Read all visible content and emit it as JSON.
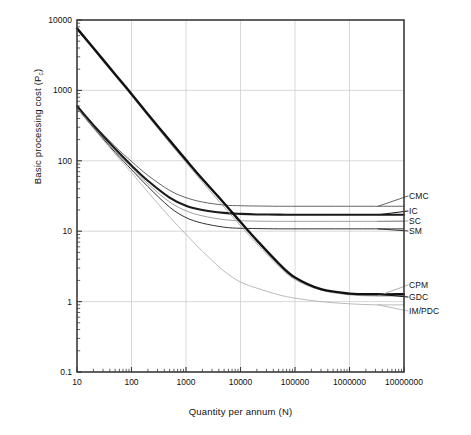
{
  "chart_data": {
    "type": "line",
    "title": "",
    "xlabel": "Quantity per annum (N)",
    "ylabel_prefix": "Basic processing cost (P",
    "ylabel_sub": "c",
    "ylabel_suffix": ")",
    "xscale": "log",
    "yscale": "log",
    "xlim": [
      10,
      10000000
    ],
    "ylim": [
      0.1,
      10000
    ],
    "grid": true,
    "legend_position": "right-inline",
    "xticks": [
      10,
      100,
      1000,
      10000,
      100000,
      1000000,
      10000000
    ],
    "xtick_labels": [
      "10",
      "100",
      "1000",
      "10000",
      "100000",
      "1000000",
      "10000000"
    ],
    "yticks": [
      0.1,
      1,
      10,
      100,
      1000,
      10000
    ],
    "ytick_labels": [
      "0.1",
      "1",
      "10",
      "100",
      "1000",
      "10000"
    ],
    "series": [
      {
        "name": "CMC",
        "label": "CMC",
        "color": "#555555",
        "width": 0.9,
        "label_y": 196,
        "x": [
          10,
          20,
          50,
          100,
          200,
          500,
          1000,
          2000,
          5000,
          10000,
          20000,
          50000,
          100000,
          300000,
          1000000,
          3000000,
          10000000
        ],
        "y": [
          600,
          330,
          160,
          98,
          62,
          38,
          30,
          26,
          23.5,
          23.0,
          22.8,
          22.6,
          22.6,
          22.6,
          22.6,
          22.6,
          22.6
        ]
      },
      {
        "name": "IC",
        "label": "IC",
        "color": "#1a1a1a",
        "width": 2.1,
        "label_y": 211,
        "x": [
          10,
          20,
          50,
          100,
          200,
          500,
          1000,
          2000,
          5000,
          10000,
          20000,
          50000,
          100000,
          300000,
          1000000,
          3000000,
          10000000
        ],
        "y": [
          600,
          320,
          148,
          86,
          52,
          30,
          23,
          20,
          18.2,
          17.6,
          17.3,
          17.2,
          17.1,
          17.1,
          17.1,
          17.1,
          17.1
        ]
      },
      {
        "name": "SC",
        "label": "SC",
        "color": "#888888",
        "width": 0.8,
        "label_y": 221,
        "x": [
          10,
          20,
          50,
          100,
          200,
          500,
          1000,
          2000,
          5000,
          10000,
          20000,
          50000,
          100000,
          300000,
          1000000,
          3000000,
          10000000
        ],
        "y": [
          560,
          300,
          138,
          80,
          47,
          26,
          19.5,
          16.5,
          14.6,
          14.1,
          13.9,
          13.8,
          13.8,
          13.8,
          13.8,
          13.8,
          13.8
        ]
      },
      {
        "name": "SM",
        "label": "SM",
        "color": "#333333",
        "width": 1.0,
        "label_y": 231,
        "x": [
          10,
          20,
          50,
          100,
          200,
          500,
          1000,
          2000,
          5000,
          10000,
          20000,
          50000,
          100000,
          300000,
          1000000,
          3000000,
          10000000
        ],
        "y": [
          560,
          295,
          132,
          75,
          43,
          22,
          15.6,
          13.0,
          11.4,
          11.0,
          10.9,
          10.8,
          10.8,
          10.8,
          10.8,
          10.8,
          10.8
        ]
      },
      {
        "name": "CPM",
        "label": "CPM",
        "color": "#9a9a9a",
        "width": 0.8,
        "label_y": 285,
        "x": [
          10,
          20,
          50,
          100,
          200,
          500,
          1000,
          2000,
          5000,
          10000,
          20000,
          50000,
          100000,
          300000,
          1000000,
          3000000,
          10000000
        ],
        "y": [
          7300,
          3800,
          1600,
          840,
          430,
          180,
          95,
          50,
          22,
          12.0,
          6.6,
          3.2,
          2.05,
          1.45,
          1.25,
          1.2,
          1.2
        ]
      },
      {
        "name": "GDC",
        "label": "GDC",
        "color": "#111111",
        "width": 2.4,
        "label_y": 297,
        "x": [
          10,
          20,
          50,
          100,
          200,
          500,
          1000,
          2000,
          5000,
          10000,
          20000,
          50000,
          100000,
          300000,
          1000000,
          3000000,
          10000000
        ],
        "y": [
          7600,
          4000,
          1700,
          890,
          460,
          195,
          103,
          55,
          25,
          13.5,
          7.4,
          3.5,
          2.2,
          1.5,
          1.3,
          1.27,
          1.27
        ]
      },
      {
        "name": "IM/PDC",
        "label": "IM/PDC",
        "color": "#a8a8a8",
        "width": 0.8,
        "label_y": 311,
        "x": [
          10,
          20,
          50,
          100,
          200,
          500,
          1000,
          2000,
          5000,
          10000,
          20000,
          50000,
          100000,
          300000,
          1000000,
          3000000,
          10000000
        ],
        "y": [
          560,
          290,
          125,
          68,
          36,
          16,
          9.0,
          5.2,
          2.7,
          1.9,
          1.55,
          1.25,
          1.12,
          1.0,
          0.93,
          0.9,
          0.9
        ]
      }
    ]
  },
  "axes": {
    "frame_color": "#3a3a3a",
    "grid_color": "#c8c8c8"
  }
}
